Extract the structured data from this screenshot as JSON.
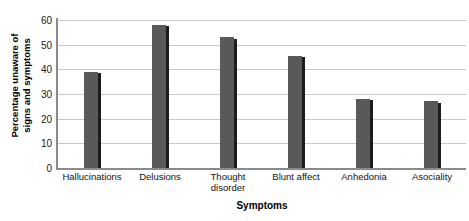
{
  "chart_data": {
    "type": "bar",
    "title": "",
    "xlabel": "Symptoms",
    "ylabel": "Percentage unaware of signs and symptoms",
    "ylabel_line1": "Percentage unaware of",
    "ylabel_line2": "signs and symptoms",
    "categories": [
      "Hallucinations",
      "Delusions",
      "Thought disorder",
      "Blunt affect",
      "Anhedonia",
      "Asociality"
    ],
    "category_lines": [
      [
        "Hallucinations"
      ],
      [
        "Delusions"
      ],
      [
        "Thought",
        "disorder"
      ],
      [
        "Blunt affect"
      ],
      [
        "Anhedonia"
      ],
      [
        "Asociality"
      ]
    ],
    "values": [
      39,
      58,
      53,
      45.5,
      28,
      27
    ],
    "ylim": [
      0,
      60
    ],
    "yticks": [
      0,
      10,
      20,
      30,
      40,
      50,
      60
    ],
    "ytick_labels": [
      "0",
      "10",
      "20",
      "30",
      "40",
      "50",
      "60"
    ],
    "grid": true,
    "grid_axis": "y",
    "legend": false,
    "bar_color": "#595959",
    "bar_edge_color": "#1c1c1c",
    "grid_color": "#c8c8c8",
    "axis_color": "#8a8a8a",
    "background": "#ffffff"
  }
}
